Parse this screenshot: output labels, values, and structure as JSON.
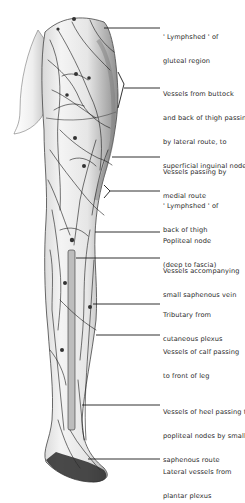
{
  "figure": {
    "colors": {
      "ink": "#1a1a1a",
      "skin_light": "#f2f2f2",
      "skin_shade": "#9a9a9a",
      "label_text": "#2a2a2a"
    }
  },
  "labels": [
    {
      "id": "lymphshed-gluteal",
      "line1": "' Lymphshed ' of",
      "line2": "gluteal region",
      "line3": "",
      "line4": "",
      "y": 4,
      "target_y": 28
    },
    {
      "id": "buttock-lateral",
      "line1": "Vessels from buttock",
      "line2": "and back of thigh passing,",
      "line3": "by lateral route, to",
      "line4": "superficial inguinal nodes",
      "y": 74,
      "target_y": 88
    },
    {
      "id": "medial-route",
      "line1": "Vessels passing by",
      "line2": "medial route",
      "line3": "",
      "line4": "",
      "y": 152,
      "target_y": 157
    },
    {
      "id": "lymphshed-thigh",
      "line1": "' Lymphshed ' of",
      "line2": "back of thigh",
      "line3": "",
      "line4": "",
      "y": 185,
      "target_y": 191
    },
    {
      "id": "popliteal-node",
      "line1": "Popliteal node",
      "line2": "(deep to fascia)",
      "line3": "",
      "line4": "",
      "y": 219,
      "target_y": 232
    },
    {
      "id": "small-saphenous",
      "line1": "Vessels accompanying",
      "line2": "small saphenous vein",
      "line3": "",
      "line4": "",
      "y": 250,
      "target_y": 258
    },
    {
      "id": "tributary",
      "line1": "Tributary from",
      "line2": "cutaneous plexus",
      "line3": "",
      "line4": "",
      "y": 293,
      "target_y": 304
    },
    {
      "id": "calf-front",
      "line1": "Vessels of calf passing",
      "line2": "to front of leg",
      "line3": "",
      "line4": "",
      "y": 331,
      "target_y": 335
    },
    {
      "id": "heel-popliteal",
      "line1": "Vessels of heel passing to",
      "line2": "popliteal nodes by small",
      "line3": "saphenous route",
      "line4": "",
      "y": 391,
      "target_y": 405
    },
    {
      "id": "lateral-plantar",
      "line1": "Lateral vessels from",
      "line2": "plantar plexus",
      "line3": "",
      "line4": "",
      "y": 451,
      "target_y": 459
    }
  ]
}
